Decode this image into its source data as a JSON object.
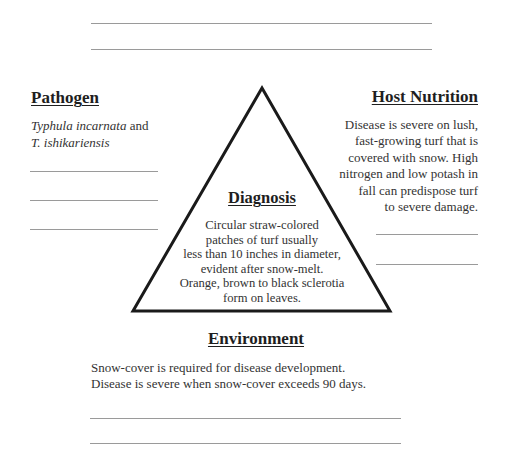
{
  "top_lines": [
    {
      "x1": 91,
      "x2": 432,
      "y": 23
    },
    {
      "x1": 91,
      "x2": 432,
      "y": 49
    }
  ],
  "pathogen": {
    "heading": "Pathogen",
    "species_italic_1": "Typhula incarnata",
    "connector": " and",
    "species_italic_2": "T. ishikariensis",
    "blank_lines": [
      171,
      200,
      229
    ]
  },
  "host_nutrition": {
    "heading": "Host Nutrition",
    "text": "Disease is severe on lush,\nfast-growing turf that is\ncovered with snow.  High\nnitrogen and low potash in\nfall can predispose turf\nto severe damage.",
    "blank_lines": [
      234,
      264
    ]
  },
  "diagnosis": {
    "heading": "Diagnosis",
    "text": "Circular straw-colored\npatches of turf usually\nless than 10 inches in diameter,\nevident after snow-melt.\nOrange, brown to black sclerotia\nform on leaves."
  },
  "environment": {
    "heading": "Environment",
    "text": "Snow-cover is required for disease development.\nDisease is severe when snow-cover exceeds 90 days.",
    "blank_lines": [
      418,
      443
    ]
  },
  "triangle": {
    "apex": [
      262,
      88
    ],
    "bottom_left": [
      133,
      311
    ],
    "bottom_right": [
      390,
      311
    ],
    "stroke": "#1a1a1a"
  }
}
